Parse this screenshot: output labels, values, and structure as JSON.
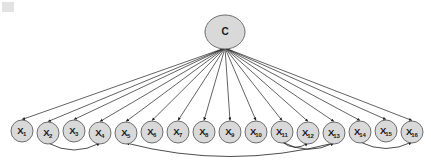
{
  "figure": {
    "background_color": "#ffffff",
    "node_fill_color": "#d9d9d9",
    "node_stroke_color": "#6e6e6e",
    "edge_color": "#1f1f1f",
    "label_color": "#1a1a1a",
    "width": 431,
    "height": 167
  },
  "chart_data": {
    "type": "diagram",
    "diagram_kind": "directed-graph",
    "nodes": [
      {
        "id": "C",
        "label_main": "C",
        "label_sub": "",
        "x": 225,
        "y": 32,
        "rx": 20,
        "ry": 17,
        "role": "class"
      },
      {
        "id": "X1",
        "label_main": "X",
        "label_sub": "1",
        "x": 22,
        "y": 131,
        "rx": 11,
        "ry": 11,
        "role": "feature"
      },
      {
        "id": "X2",
        "label_main": "X",
        "label_sub": "2",
        "x": 48,
        "y": 133,
        "rx": 11,
        "ry": 11,
        "role": "feature"
      },
      {
        "id": "X3",
        "label_main": "X",
        "label_sub": "3",
        "x": 74,
        "y": 131,
        "rx": 11,
        "ry": 11,
        "role": "feature"
      },
      {
        "id": "X4",
        "label_main": "X",
        "label_sub": "4",
        "x": 100,
        "y": 133,
        "rx": 11,
        "ry": 11,
        "role": "feature"
      },
      {
        "id": "X5",
        "label_main": "X",
        "label_sub": "5",
        "x": 126,
        "y": 133,
        "rx": 11,
        "ry": 11,
        "role": "feature"
      },
      {
        "id": "X6",
        "label_main": "X",
        "label_sub": "6",
        "x": 152,
        "y": 132,
        "rx": 11,
        "ry": 11,
        "role": "feature"
      },
      {
        "id": "X7",
        "label_main": "X",
        "label_sub": "7",
        "x": 178,
        "y": 132,
        "rx": 11,
        "ry": 11,
        "role": "feature"
      },
      {
        "id": "X8",
        "label_main": "X",
        "label_sub": "8",
        "x": 204,
        "y": 132,
        "rx": 11,
        "ry": 11,
        "role": "feature"
      },
      {
        "id": "X9",
        "label_main": "X",
        "label_sub": "9",
        "x": 230,
        "y": 132,
        "rx": 11,
        "ry": 11,
        "role": "feature"
      },
      {
        "id": "X10",
        "label_main": "X",
        "label_sub": "10",
        "x": 256,
        "y": 132,
        "rx": 11,
        "ry": 11,
        "role": "feature"
      },
      {
        "id": "X11",
        "label_main": "X",
        "label_sub": "11",
        "x": 282,
        "y": 132,
        "rx": 11,
        "ry": 11,
        "role": "feature"
      },
      {
        "id": "X12",
        "label_main": "X",
        "label_sub": "12",
        "x": 308,
        "y": 133,
        "rx": 11,
        "ry": 11,
        "role": "feature"
      },
      {
        "id": "X13",
        "label_main": "X",
        "label_sub": "13",
        "x": 334,
        "y": 133,
        "rx": 11,
        "ry": 11,
        "role": "feature"
      },
      {
        "id": "X14",
        "label_main": "X",
        "label_sub": "14",
        "x": 360,
        "y": 132,
        "rx": 11,
        "ry": 11,
        "role": "feature"
      },
      {
        "id": "X15",
        "label_main": "X",
        "label_sub": "15",
        "x": 386,
        "y": 131,
        "rx": 11,
        "ry": 11,
        "role": "feature"
      },
      {
        "id": "X16",
        "label_main": "X",
        "label_sub": "16",
        "x": 412,
        "y": 132,
        "rx": 11,
        "ry": 11,
        "role": "feature"
      }
    ],
    "class_edges": [
      {
        "from": "C",
        "to": "X1"
      },
      {
        "from": "C",
        "to": "X2"
      },
      {
        "from": "C",
        "to": "X3"
      },
      {
        "from": "C",
        "to": "X4"
      },
      {
        "from": "C",
        "to": "X5"
      },
      {
        "from": "C",
        "to": "X6"
      },
      {
        "from": "C",
        "to": "X7"
      },
      {
        "from": "C",
        "to": "X8"
      },
      {
        "from": "C",
        "to": "X9"
      },
      {
        "from": "C",
        "to": "X10"
      },
      {
        "from": "C",
        "to": "X11"
      },
      {
        "from": "C",
        "to": "X12"
      },
      {
        "from": "C",
        "to": "X13"
      },
      {
        "from": "C",
        "to": "X14"
      },
      {
        "from": "C",
        "to": "X15"
      },
      {
        "from": "C",
        "to": "X16"
      }
    ],
    "augmenting_edges": [
      {
        "from": "X2",
        "to": "X4",
        "depth": 14
      },
      {
        "from": "X13",
        "to": "X5",
        "depth": 27
      },
      {
        "from": "X11",
        "to": "X12",
        "depth": 9
      },
      {
        "from": "X11",
        "to": "X13",
        "depth": 13
      },
      {
        "from": "X14",
        "to": "X16",
        "depth": 13
      }
    ]
  }
}
